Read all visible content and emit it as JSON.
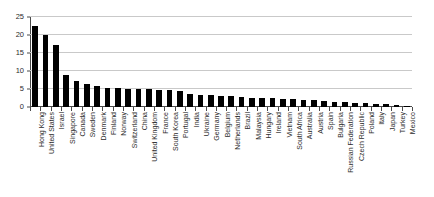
{
  "chart_data": {
    "type": "bar",
    "title": "",
    "subtitle": "",
    "xlabel": "",
    "ylabel": "",
    "ylim": [
      0,
      25
    ],
    "yticks": [
      0,
      5,
      10,
      15,
      20,
      25
    ],
    "ytick_labels": [
      "0",
      "5",
      "10",
      "15",
      "20",
      "25"
    ],
    "grid": true,
    "legend": false,
    "legend_position": "none",
    "orientation": "vertical",
    "bar_color": "#000000",
    "gridline_color": "#c9c9c9",
    "axis_color": "#4a4a4a",
    "background_color": "#ffffff",
    "categories": [
      "Hong Kong",
      "United States",
      "Israel",
      "Singapore",
      "Canada",
      "Sweden",
      "Denmark",
      "Finland",
      "Norway",
      "Switzerland",
      "China",
      "United Kingdom",
      "France",
      "South Korea",
      "Portugal",
      "India",
      "Ukraine",
      "Germany",
      "Belgium",
      "Netherlands",
      "Brazil",
      "Malaysia",
      "Hungary",
      "Ireland",
      "Vietnam",
      "South Africa",
      "Australia",
      "Austria",
      "Spain",
      "Bulgaria",
      "Russian Federation",
      "Czech Republic",
      "Poland",
      "Italy",
      "Japan",
      "Turkey",
      "Mexico"
    ],
    "values": [
      22.5,
      19.9,
      17.1,
      9.0,
      7.3,
      6.4,
      5.9,
      5.4,
      5.2,
      5.1,
      5.0,
      4.9,
      4.7,
      4.6,
      4.5,
      3.6,
      3.3,
      3.2,
      3.1,
      3.0,
      2.8,
      2.6,
      2.5,
      2.4,
      2.3,
      2.2,
      2.0,
      1.9,
      1.8,
      1.5,
      1.3,
      1.2,
      1.1,
      0.9,
      0.7,
      0.5,
      0.3
    ]
  }
}
